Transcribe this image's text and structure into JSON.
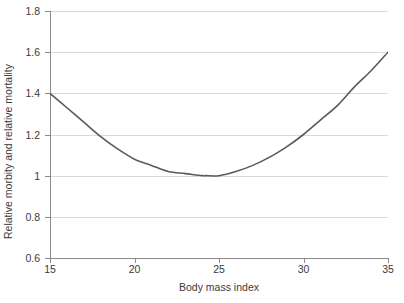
{
  "chart_data": {
    "type": "line",
    "title": "",
    "subtitle": "",
    "xlabel": "Body mass index",
    "ylabel": "Relative morbity and relative mortality",
    "xlim": [
      15,
      35
    ],
    "ylim": [
      0.6,
      1.8
    ],
    "xticks": [
      15,
      20,
      25,
      30,
      35
    ],
    "xtick_labels": [
      "15",
      "20",
      "25",
      "30",
      "35"
    ],
    "yticks": [
      0.6,
      0.8,
      1.0,
      1.2,
      1.4,
      1.6,
      1.8
    ],
    "ytick_labels": [
      "0.6",
      "0.8",
      "1",
      "1.2",
      "1.4",
      "1.6",
      "1.8"
    ],
    "grid": "horizontal",
    "legend": "none",
    "series": [
      {
        "name": "Relative morbidity and mortality",
        "color": "#5a5a5a",
        "x": [
          15,
          16,
          17,
          18,
          19,
          20,
          21,
          22,
          23,
          24,
          24.2,
          25,
          26,
          27,
          28,
          29,
          30,
          31,
          32,
          33,
          34,
          35
        ],
        "values": [
          1.4,
          1.33,
          1.26,
          1.19,
          1.13,
          1.08,
          1.05,
          1.02,
          1.01,
          1.0,
          1.0,
          1.0,
          1.02,
          1.05,
          1.09,
          1.14,
          1.2,
          1.27,
          1.34,
          1.43,
          1.51,
          1.6
        ]
      }
    ],
    "annotations": {
      "minimum_x": 24.2,
      "minimum_y": 1.0,
      "left_endpoint": [
        15,
        1.4
      ],
      "right_endpoint": [
        35,
        1.6
      ]
    },
    "colors": {
      "curve": "#5a5a5a",
      "gridline": "#d9d9d9",
      "axis": "#8a8a8a",
      "text": "#3a3a3a",
      "background": "#ffffff"
    }
  }
}
